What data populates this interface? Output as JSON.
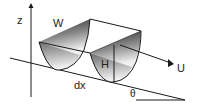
{
  "diagram": {
    "type": "channel-geometry-schematic",
    "labels": {
      "z_axis": "z",
      "width": "W",
      "height": "H",
      "velocity": "U",
      "length_element": "dx",
      "slope_angle": "θ"
    },
    "colors": {
      "stroke": "#1a1a1a",
      "fill_dark": "#2a2a2a",
      "fill_light": "#f0f0f0",
      "background": "#ffffff"
    }
  }
}
